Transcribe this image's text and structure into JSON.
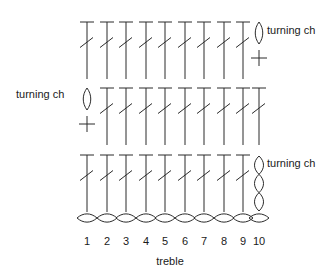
{
  "figure": {
    "caption": "treble",
    "caption_x": 170,
    "caption_y": 256,
    "background_color": "#ffffff",
    "stroke_color": "#2b2b2b"
  },
  "labels": [
    {
      "name": "turning-ch-top-right",
      "text": "turning ch",
      "x": 267,
      "y": 25
    },
    {
      "name": "turning-ch-middle-left",
      "text": "turning ch",
      "x": 16,
      "y": 89
    },
    {
      "name": "turning-ch-bottom-right",
      "text": "turning ch",
      "x": 267,
      "y": 158
    }
  ],
  "stitch_numbers": {
    "y": 236,
    "values": [
      "1",
      "2",
      "3",
      "4",
      "5",
      "6",
      "7",
      "8",
      "9",
      "10"
    ],
    "x_positions": [
      87,
      107,
      126,
      146,
      165,
      185,
      204,
      224,
      243,
      259
    ]
  },
  "chart_data": {
    "type": "diagram",
    "title": "treble",
    "diagram_kind": "crochet-stitch-chart",
    "columns": 10,
    "column_x": [
      87,
      107,
      126,
      146,
      165,
      185,
      204,
      224,
      243,
      259
    ],
    "foundation_chain": {
      "name": "foundation-chain",
      "stitch": "chain",
      "count": 10,
      "y": 218,
      "link_width": 20,
      "link_height": 11,
      "orientation": "horizontal"
    },
    "rows": [
      {
        "name": "row-1-bottom",
        "index": 1,
        "y_top": 155,
        "y_bottom": 212,
        "direction": "right-to-left",
        "turning_chain": {
          "position": "right",
          "column": 10,
          "stitch": "chain",
          "count": 3,
          "label": "turning ch",
          "orientation": "vertical"
        },
        "stitches": [
          {
            "symbol": "treble",
            "column": 1
          },
          {
            "symbol": "treble",
            "column": 2
          },
          {
            "symbol": "treble",
            "column": 3
          },
          {
            "symbol": "treble",
            "column": 4
          },
          {
            "symbol": "treble",
            "column": 5
          },
          {
            "symbol": "treble",
            "column": 6
          },
          {
            "symbol": "treble",
            "column": 7
          },
          {
            "symbol": "treble",
            "column": 8
          },
          {
            "symbol": "treble",
            "column": 9
          }
        ]
      },
      {
        "name": "row-2-middle",
        "index": 2,
        "y_top": 88,
        "y_bottom": 145,
        "direction": "left-to-right",
        "turning_chain": {
          "position": "left",
          "column": 1,
          "stitch": "chain-plus-single",
          "count": 1,
          "label": "turning ch",
          "orientation": "vertical"
        },
        "stitches": [
          {
            "symbol": "treble",
            "column": 2
          },
          {
            "symbol": "treble",
            "column": 3
          },
          {
            "symbol": "treble",
            "column": 4
          },
          {
            "symbol": "treble",
            "column": 5
          },
          {
            "symbol": "treble",
            "column": 6
          },
          {
            "symbol": "treble",
            "column": 7
          },
          {
            "symbol": "treble",
            "column": 8
          },
          {
            "symbol": "treble",
            "column": 9
          },
          {
            "symbol": "treble",
            "column": 10
          }
        ]
      },
      {
        "name": "row-3-top",
        "index": 3,
        "y_top": 22,
        "y_bottom": 79,
        "direction": "right-to-left",
        "turning_chain": {
          "position": "right",
          "column": 10,
          "stitch": "chain-plus-single",
          "count": 1,
          "label": "turning ch",
          "orientation": "vertical"
        },
        "stitches": [
          {
            "symbol": "treble",
            "column": 1
          },
          {
            "symbol": "treble",
            "column": 2
          },
          {
            "symbol": "treble",
            "column": 3
          },
          {
            "symbol": "treble",
            "column": 4
          },
          {
            "symbol": "treble",
            "column": 5
          },
          {
            "symbol": "treble",
            "column": 6
          },
          {
            "symbol": "treble",
            "column": 7
          },
          {
            "symbol": "treble",
            "column": 8
          },
          {
            "symbol": "treble",
            "column": 9
          }
        ]
      }
    ],
    "symbol_legend": [
      {
        "symbol": "treble",
        "description": "vertical stem with top crossbar and one diagonal slash"
      },
      {
        "symbol": "chain",
        "description": "lens shaped oval"
      },
      {
        "symbol": "single",
        "description": "plus / cross"
      }
    ]
  }
}
